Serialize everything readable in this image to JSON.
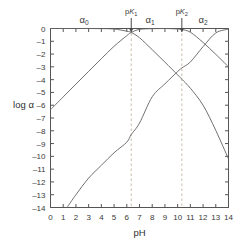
{
  "chart_data": {
    "type": "line",
    "title": "",
    "xlabel": "pH",
    "ylabel": "log α",
    "xlim": [
      0,
      14
    ],
    "ylim": [
      -14,
      0
    ],
    "xticks": [
      "0",
      "1",
      "2",
      "3",
      "4",
      "5",
      "6",
      "7",
      "8",
      "9",
      "10",
      "11",
      "12",
      "13",
      "14"
    ],
    "yticks": [
      "0",
      "–1",
      "–2",
      "–3",
      "–4",
      "–5",
      "–6",
      "–7",
      "–8",
      "–9",
      "–10",
      "–11",
      "–12",
      "–13",
      "–14"
    ],
    "grid": false,
    "legend_position": "none",
    "constants": {
      "pK1": 6.35,
      "pK2": 10.33
    },
    "series": [
      {
        "name": "α₀",
        "label": "alpha-0 (H2A)",
        "color": "#707070",
        "x": [
          0,
          1,
          2,
          3,
          4,
          5,
          6,
          6.35,
          7,
          8,
          9,
          10,
          10.33,
          11,
          12,
          13,
          14
        ],
        "values": [
          0.0,
          0.0,
          0.0,
          0.0,
          -0.01,
          -0.04,
          -0.21,
          -0.31,
          -0.72,
          -1.66,
          -2.63,
          -3.63,
          -3.97,
          -4.67,
          -6.0,
          -7.97,
          -10.2
        ]
      },
      {
        "name": "α₁",
        "label": "alpha-1 (HA-)",
        "color": "#707070",
        "x": [
          0,
          1,
          2,
          3,
          4,
          5,
          6,
          6.35,
          7,
          8,
          9,
          10,
          10.33,
          11,
          12,
          13,
          14
        ],
        "values": [
          -6.35,
          -5.35,
          -4.35,
          -3.35,
          -2.36,
          -1.39,
          -0.56,
          -0.31,
          -0.07,
          -0.01,
          0.0,
          -0.04,
          -0.08,
          -0.29,
          -1.09,
          -2.02,
          -3.0
        ]
      },
      {
        "name": "α₂",
        "label": "alpha-2 (A2-)",
        "color": "#707070",
        "x": [
          1.3,
          2,
          3,
          4,
          5,
          6,
          6.35,
          7,
          8,
          9,
          10,
          10.33,
          11,
          12,
          13,
          14
        ],
        "values": [
          -14.0,
          -13.0,
          -11.7,
          -10.7,
          -9.72,
          -8.89,
          -8.29,
          -7.4,
          -5.34,
          -4.33,
          -3.37,
          -3.08,
          -2.62,
          -1.42,
          -0.35,
          -0.05
        ]
      }
    ],
    "annotations": [
      {
        "name": "alpha-0-region-label",
        "text": "α",
        "sub": "0",
        "x_px": 84,
        "y_px": 23
      },
      {
        "name": "alpha-1-region-label",
        "text": "α",
        "sub": "1",
        "x_px": 150,
        "y_px": 23
      },
      {
        "name": "alpha-2-region-label",
        "text": "α",
        "sub": "2",
        "x_px": 203,
        "y_px": 23
      },
      {
        "name": "pk1-label",
        "prefix": "p",
        "italic": "K",
        "sub": "1",
        "x": 6.35,
        "y_px": 14
      },
      {
        "name": "pk2-label",
        "prefix": "p",
        "italic": "K",
        "sub": "2",
        "x": 10.33,
        "y_px": 14
      }
    ],
    "guides": [
      {
        "name": "pk1-guide",
        "x": 6.35,
        "style": "dashed",
        "color": "#c9bfa8"
      },
      {
        "name": "pk2-guide",
        "x": 10.33,
        "style": "dashed",
        "color": "#c9bfa8"
      }
    ],
    "arrows": [
      {
        "name": "pk1-arrow",
        "x": 6.35
      },
      {
        "name": "pk2-arrow",
        "x": 10.33
      }
    ]
  },
  "axes": {
    "x_label": "pH",
    "y_label": "log α"
  }
}
